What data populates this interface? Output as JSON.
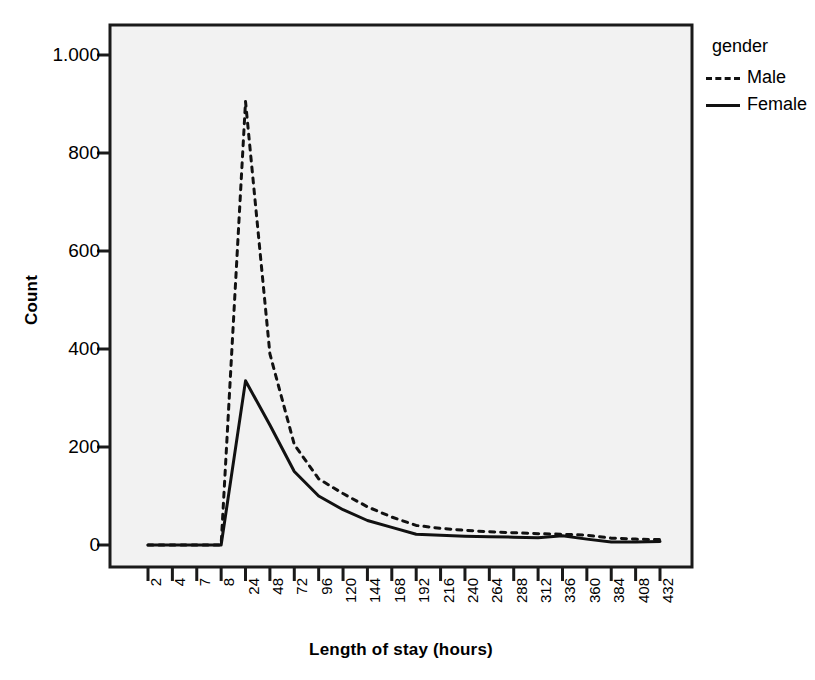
{
  "chart_data": {
    "type": "line",
    "title": "",
    "xlabel": "Length of stay (hours)",
    "ylabel": "Count",
    "categories": [
      "2",
      "4",
      "7",
      "8",
      "24",
      "48",
      "72",
      "96",
      "120",
      "144",
      "168",
      "192",
      "216",
      "240",
      "264",
      "288",
      "312",
      "336",
      "360",
      "384",
      "408",
      "432"
    ],
    "yticks": [
      "0",
      "200",
      "400",
      "600",
      "800",
      "1.000"
    ],
    "ytick_values": [
      0,
      200,
      400,
      600,
      800,
      1000
    ],
    "ylim": [
      0,
      1060
    ],
    "grid": false,
    "legend": {
      "title": "gender",
      "position": "right-top",
      "entries": [
        {
          "name": "Male",
          "style": "dashed"
        },
        {
          "name": "Female",
          "style": "solid"
        }
      ]
    },
    "series": [
      {
        "name": "Male",
        "style": "dashed",
        "color": "#111111",
        "values": [
          0,
          0,
          0,
          0,
          905,
          390,
          205,
          135,
          105,
          78,
          57,
          40,
          34,
          30,
          27,
          25,
          23,
          22,
          20,
          14,
          12,
          11
        ]
      },
      {
        "name": "Female",
        "style": "solid",
        "color": "#111111",
        "values": [
          0,
          0,
          0,
          0,
          335,
          245,
          150,
          100,
          72,
          50,
          36,
          22,
          20,
          18,
          17,
          16,
          15,
          19,
          12,
          6,
          6,
          7
        ]
      }
    ]
  },
  "colors": {
    "plot_background": "#f2f2f2",
    "frame": "#1a1a1a",
    "ink": "#111111"
  }
}
